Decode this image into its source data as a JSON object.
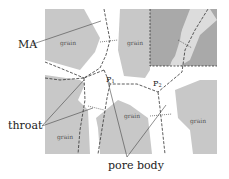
{
  "diagram": {
    "type": "pore network schematic",
    "colors": {
      "grain": "#c8c8c8",
      "grain_dark": "#a9a9a9",
      "pore": "#ffffff",
      "line": "#333333"
    },
    "grain_labels": [
      "grain",
      "grain",
      "grain",
      "grain",
      "grain"
    ],
    "pore_labels": {
      "p1": "P",
      "p1_sub": "1",
      "p2": "P",
      "p2_sub": "2"
    },
    "callouts": {
      "ma": "MA",
      "throat": "throat",
      "pore_body": "pore body"
    }
  }
}
